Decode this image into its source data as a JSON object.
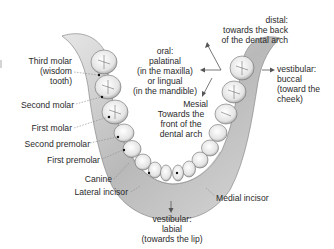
{
  "diagram": {
    "tooth_labels": [
      {
        "id": "third-molar",
        "lines": [
          "Third molar",
          "(wisdom",
          "tooth)"
        ]
      },
      {
        "id": "second-molar",
        "lines": [
          "Second molar"
        ]
      },
      {
        "id": "first-molar",
        "lines": [
          "First molar"
        ]
      },
      {
        "id": "second-premolar",
        "lines": [
          "Second premolar"
        ]
      },
      {
        "id": "first-premolar",
        "lines": [
          "First premolar"
        ]
      },
      {
        "id": "canine",
        "lines": [
          "Canine"
        ]
      },
      {
        "id": "lateral-incisor",
        "lines": [
          "Lateral incisor"
        ]
      },
      {
        "id": "medial-incisor",
        "lines": [
          "Medial incisor"
        ]
      }
    ],
    "direction_labels": {
      "distal": {
        "title": "distal:",
        "lines": [
          "towards the back",
          "of the dental arch"
        ]
      },
      "oral": {
        "title": "oral:",
        "lines": [
          "palatinal",
          "(in the maxilla)",
          "or lingual",
          "(in the mandible)"
        ]
      },
      "mesial": {
        "title": "Mesial",
        "lines": [
          "Towards the",
          "front of the",
          "dental arch"
        ]
      },
      "vestibular_buccal": {
        "title": "vestibular:",
        "lines": [
          "buccal",
          "(toward the",
          "cheek)"
        ]
      },
      "vestibular_labial": {
        "title": "vestibular:",
        "lines": [
          "labial",
          "(towards the lip)"
        ]
      }
    },
    "colors": {
      "background": "#ffffff",
      "text": "#2a2a2a",
      "bone": "#cfcfcf",
      "tooth": "#f2f2f2",
      "shadow": "#8c8c8c"
    }
  }
}
